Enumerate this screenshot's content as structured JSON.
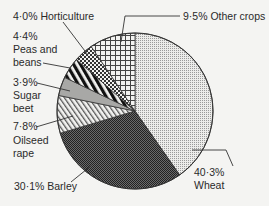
{
  "chart_data": {
    "type": "pie",
    "title": "",
    "start_angle_deg": 0,
    "direction": "clockwise",
    "slices": [
      {
        "label": "Wheat",
        "value": 40.3,
        "display": "40·3%",
        "pattern": "fine-dots"
      },
      {
        "label": "Barley",
        "value": 30.1,
        "display": "30·1%",
        "pattern": "dark-checker"
      },
      {
        "label": "Oilseed rape",
        "value": 7.8,
        "display": "7·8%",
        "pattern": "diagonal-hatch"
      },
      {
        "label": "Sugar beet",
        "value": 3.9,
        "display": "3·9%",
        "pattern": "solid-grey"
      },
      {
        "label": "Peas and beans",
        "value": 4.4,
        "display": "4·4%",
        "pattern": "bold-diagonal-stripes"
      },
      {
        "label": "Horticulture",
        "value": 4.0,
        "display": "4·0%",
        "pattern": "small-checker"
      },
      {
        "label": "Other crops",
        "value": 9.5,
        "display": "9·5%",
        "pattern": "grid"
      }
    ],
    "legend": "none (direct labels with leader lines)"
  },
  "labels": {
    "horticulture": "4·0% Horticulture",
    "other": "9·5% Other crops",
    "peas_pct": "4·4%",
    "peas_l1": "Peas and",
    "peas_l2": "beans",
    "sugar_pct": "3·9%",
    "sugar_l1": "Sugar",
    "sugar_l2": "beet",
    "oil_pct": "7·8%",
    "oil_l1": "Oilseed",
    "oil_l2": "rape",
    "barley": "30·1% Barley",
    "wheat_pct": "40·3%",
    "wheat_l1": "Wheat"
  }
}
